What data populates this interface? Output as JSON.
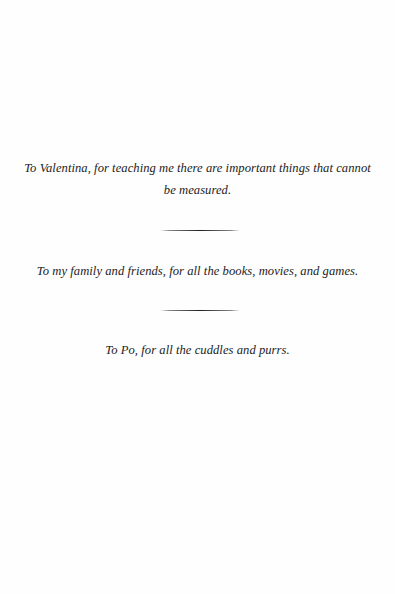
{
  "page": {
    "type": "dedication",
    "dedications": [
      {
        "text": "To Valentina, for teaching me there are important things that cannot be measured."
      },
      {
        "text": "To my family and friends, for all the books, movies, and games."
      },
      {
        "text": "To Po, for all the cuddles and purrs."
      }
    ],
    "dividers": [
      {
        "style": "tapered-rule"
      },
      {
        "style": "tapered-rule"
      }
    ]
  },
  "colors": {
    "background": "#fefefe",
    "text": "#222222",
    "rule": "#141414"
  }
}
